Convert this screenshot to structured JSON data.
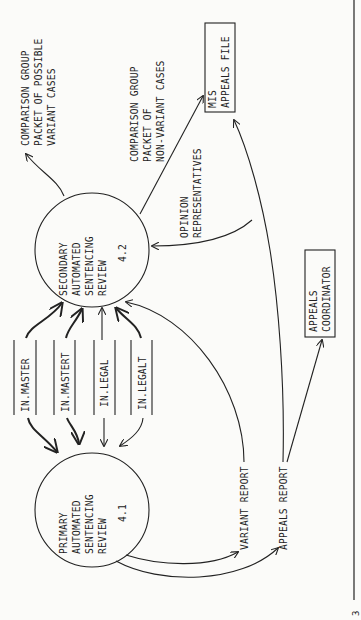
{
  "diagram": {
    "orientation": "rotated-90-ccw",
    "processes": [
      {
        "id": "4.2",
        "lines": [
          "SECONDARY",
          "AUTOMATED",
          "SENTENCING",
          "REVIEW"
        ],
        "number": "4.2"
      },
      {
        "id": "4.1",
        "lines": [
          "PRIMARY",
          "AUTOMATED",
          "SENTENCING",
          "REVIEW"
        ],
        "number": "4.1"
      }
    ],
    "data_stores": [
      {
        "label": "IN.MASTER"
      },
      {
        "label": "IN.MASTERT"
      },
      {
        "label": "IN.LEGAL"
      },
      {
        "label": "IN.LEGALT"
      }
    ],
    "entities": [
      {
        "lines": [
          "MIS",
          "APPEALS FILE"
        ]
      },
      {
        "lines": [
          "APPEALS",
          "COORDINATOR"
        ]
      }
    ],
    "flows": {
      "possible_variant": [
        "COMPARISON GROUP",
        "PACKET OF POSSIBLE",
        "VARIANT CASES"
      ],
      "non_variant": [
        "COMPARISON GROUP",
        "PACKET OF",
        "NON-VARIANT CASES"
      ],
      "opinion": [
        "OPINION",
        "REPRESENTATIVES"
      ],
      "variant_report": "VARIANT REPORT",
      "appeals_report": "APPEALS REPORT"
    },
    "page_mark": "3"
  }
}
